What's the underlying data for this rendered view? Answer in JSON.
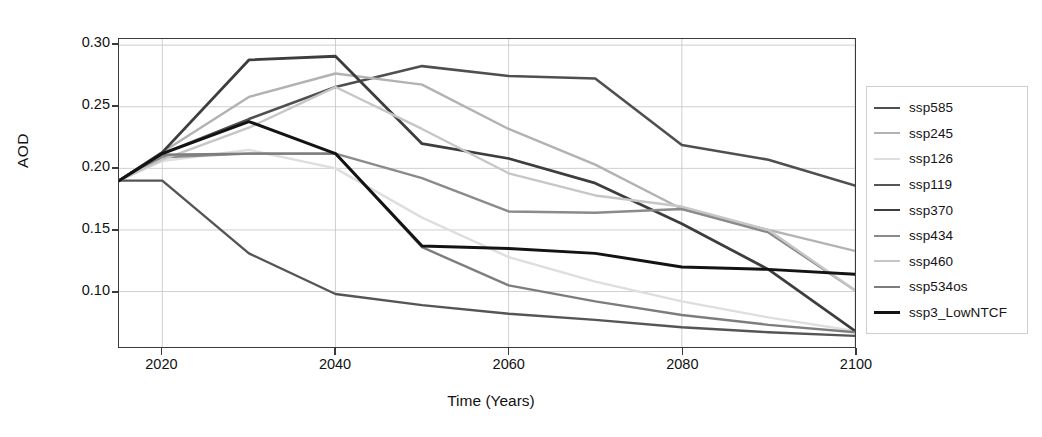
{
  "chart_data": {
    "type": "line",
    "title": "",
    "xlabel": "Time (Years)",
    "ylabel": "AOD",
    "xlim": [
      2015,
      2100
    ],
    "ylim": [
      0.055,
      0.305
    ],
    "xticks": [
      "2020",
      "2040",
      "2060",
      "2080",
      "2100"
    ],
    "xtick_values": [
      2020,
      2040,
      2060,
      2080,
      2100
    ],
    "yticks": [
      "0.10",
      "0.15",
      "0.20",
      "0.25",
      "0.30"
    ],
    "ytick_values": [
      0.1,
      0.15,
      0.2,
      0.25,
      0.3
    ],
    "grid": true,
    "legend_position": "right-outside",
    "x": [
      2015,
      2020,
      2030,
      2040,
      2050,
      2060,
      2070,
      2080,
      2090,
      2100
    ],
    "series": [
      {
        "name": "ssp585",
        "color": "#4f4f4f",
        "width": 2.6,
        "values": [
          0.19,
          0.212,
          0.24,
          0.266,
          0.283,
          0.275,
          0.273,
          0.219,
          0.207,
          0.186
        ]
      },
      {
        "name": "ssp245",
        "color": "#b2b2b2",
        "width": 2.4,
        "values": [
          0.19,
          0.213,
          0.258,
          0.277,
          0.268,
          0.232,
          0.203,
          0.167,
          0.15,
          0.133
        ]
      },
      {
        "name": "ssp126",
        "color": "#dedede",
        "width": 2.4,
        "values": [
          0.19,
          0.206,
          0.215,
          0.2,
          0.16,
          0.128,
          0.108,
          0.092,
          0.079,
          0.068
        ]
      },
      {
        "name": "ssp119",
        "color": "#555555",
        "width": 2.4,
        "values": [
          0.19,
          0.19,
          0.131,
          0.098,
          0.089,
          0.082,
          0.077,
          0.071,
          0.067,
          0.064
        ]
      },
      {
        "name": "ssp370",
        "color": "#3d3d3d",
        "width": 2.8,
        "values": [
          0.19,
          0.213,
          0.288,
          0.291,
          0.22,
          0.208,
          0.188,
          0.155,
          0.118,
          0.068
        ]
      },
      {
        "name": "ssp434",
        "color": "#8a8a8a",
        "width": 2.4,
        "values": [
          0.19,
          0.209,
          0.212,
          0.212,
          0.192,
          0.165,
          0.164,
          0.167,
          0.148,
          0.101
        ]
      },
      {
        "name": "ssp460",
        "color": "#c6c6c6",
        "width": 2.4,
        "values": [
          0.19,
          0.207,
          0.233,
          0.266,
          0.232,
          0.196,
          0.178,
          0.169,
          0.15,
          0.101
        ]
      },
      {
        "name": "ssp534os",
        "color": "#7d7d7d",
        "width": 2.4,
        "values": [
          0.19,
          0.211,
          0.212,
          0.212,
          0.136,
          0.105,
          0.092,
          0.081,
          0.073,
          0.067
        ]
      },
      {
        "name": "ssp3_LowNTCF",
        "color": "#131313",
        "width": 3.0,
        "values": [
          0.19,
          0.212,
          0.238,
          0.212,
          0.137,
          0.135,
          0.131,
          0.12,
          0.118,
          0.114
        ]
      }
    ]
  },
  "legend": {
    "items": [
      {
        "label": "ssp585"
      },
      {
        "label": "ssp245"
      },
      {
        "label": "ssp126"
      },
      {
        "label": "ssp119"
      },
      {
        "label": "ssp370"
      },
      {
        "label": "ssp434"
      },
      {
        "label": "ssp460"
      },
      {
        "label": "ssp534os"
      },
      {
        "label": "ssp3_LowNTCF"
      }
    ]
  }
}
